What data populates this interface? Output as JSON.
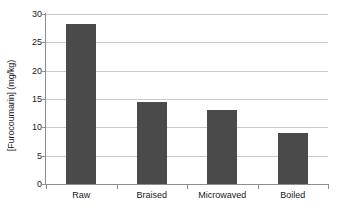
{
  "chart_data": {
    "type": "bar",
    "title": "",
    "xlabel": "",
    "ylabel": "[Furocoumarin] (mg/kg)",
    "categories": [
      "Raw",
      "Braised",
      "Microwaved",
      "Boiled"
    ],
    "values": [
      28.2,
      14.4,
      13.0,
      9.0
    ],
    "ylim": [
      0,
      30
    ],
    "yticks": [
      0,
      5,
      10,
      15,
      20,
      25,
      30
    ],
    "ytick_labels": [
      "0",
      "5",
      "10",
      "15",
      "20",
      "25",
      "30"
    ],
    "grid": true,
    "grid_axis": "y",
    "legend": false,
    "bar_color": "#4a4a4a",
    "gridline_color": "#c9c9c9",
    "axis_color": "#8d8d8d",
    "background_color": "#ffffff"
  }
}
